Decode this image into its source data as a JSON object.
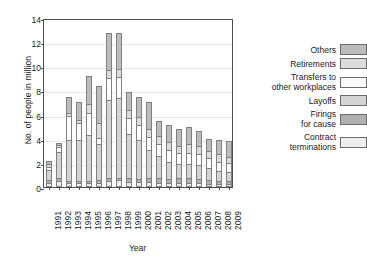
{
  "chart_data": {
    "type": "bar",
    "subtype": "stacked",
    "title": "",
    "xlabel": "Year",
    "ylabel": "No. of people in million",
    "ylim": [
      0,
      14
    ],
    "yticks": [
      0,
      2,
      4,
      6,
      8,
      10,
      12,
      14
    ],
    "grid": true,
    "legend_position": "right",
    "categories": [
      "1991",
      "1992",
      "1993",
      "1994",
      "1995",
      "1996",
      "1997",
      "1998",
      "1999",
      "2000",
      "2001",
      "2002",
      "2003",
      "2004",
      "2005",
      "2006",
      "2007",
      "2008",
      "2009"
    ],
    "series": [
      {
        "name": "Contract terminations",
        "color": "#ededed",
        "values": [
          0.35,
          0.5,
          0.3,
          0.3,
          0.3,
          0.35,
          0.5,
          0.55,
          0.45,
          0.4,
          0.4,
          0.35,
          0.3,
          0.3,
          0.3,
          0.3,
          0.25,
          0.25,
          0.25
        ]
      },
      {
        "name": "Firings for cause",
        "color": "#b0b0b0",
        "values": [
          0.35,
          0.35,
          0.3,
          0.3,
          0.3,
          0.3,
          0.3,
          0.3,
          0.35,
          0.35,
          0.4,
          0.45,
          0.45,
          0.5,
          0.5,
          0.45,
          0.4,
          0.35,
          0.35
        ]
      },
      {
        "name": "Layoffs",
        "color": "#d4d4d4",
        "values": [
          0.9,
          2.25,
          3.5,
          3.5,
          3.9,
          3.05,
          6.55,
          6.7,
          3.75,
          3.3,
          2.45,
          1.95,
          1.5,
          1.25,
          1.25,
          1.2,
          1.05,
          0.9,
          0.8
        ]
      },
      {
        "name": "Transfers to\nother workplaces",
        "color": "#fbfbfb",
        "values": [
          0.3,
          0.45,
          2.05,
          1.45,
          1.9,
          0.6,
          1.9,
          1.8,
          1.45,
          1.3,
          1.15,
          1.1,
          1.1,
          1.0,
          1.05,
          1.0,
          0.95,
          0.85,
          0.8
        ]
      },
      {
        "name": "Retirements",
        "color": "#dcdcdc",
        "values": [
          0.3,
          0.3,
          0.35,
          0.3,
          0.8,
          1.3,
          0.75,
          0.75,
          0.75,
          0.75,
          0.75,
          0.75,
          0.7,
          0.7,
          0.8,
          0.75,
          0.7,
          0.7,
          0.65
        ]
      },
      {
        "name": "Others",
        "color": "#bcbcbc",
        "values": [
          0.4,
          0.25,
          1.4,
          1.65,
          2.4,
          3.2,
          3.15,
          3.05,
          1.55,
          1.8,
          2.3,
          1.3,
          1.5,
          1.45,
          1.5,
          1.35,
          1.05,
          1.3,
          1.35
        ]
      }
    ],
    "totals": [
      2.6,
      4.1,
      7.9,
      7.5,
      9.6,
      8.8,
      13.15,
      13.15,
      8.3,
      7.9,
      7.45,
      5.9,
      5.55,
      5.2,
      5.4,
      5.05,
      4.4,
      4.35,
      4.2
    ]
  },
  "legend": {
    "entries": [
      {
        "label": "Others",
        "color": "#bcbcbc"
      },
      {
        "label": "Retirements",
        "color": "#dcdcdc"
      },
      {
        "label": "Transfers to\nother workplaces",
        "color": "#fbfbfb"
      },
      {
        "label": "Layoffs",
        "color": "#d4d4d4"
      },
      {
        "label": "Firings\nfor cause",
        "color": "#b0b0b0"
      },
      {
        "label": "Contract\nterminations",
        "color": "#ededed"
      }
    ]
  },
  "axes": {
    "y_title": "No. of people in million",
    "x_title": "Year"
  }
}
